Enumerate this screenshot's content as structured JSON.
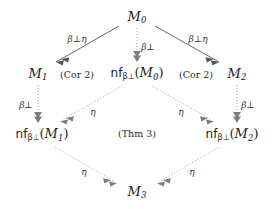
{
  "diagram": {
    "type": "commutative-diagram",
    "title": "",
    "nodes": [
      {
        "id": "M0",
        "label": "M",
        "sub": "0",
        "prefix": "",
        "x": 137,
        "y": 17
      },
      {
        "id": "M1",
        "label": "M",
        "sub": "1",
        "prefix": "",
        "x": 38,
        "y": 74
      },
      {
        "id": "nfM0",
        "label": "M",
        "sub": "0",
        "prefix": "nf",
        "opsub": "β⊥",
        "x": 137,
        "y": 74
      },
      {
        "id": "M2",
        "label": "M",
        "sub": "2",
        "prefix": "",
        "x": 237,
        "y": 74
      },
      {
        "id": "nfM1",
        "label": "M",
        "sub": "1",
        "prefix": "nf",
        "opsub": "β⊥",
        "x": 42,
        "y": 135
      },
      {
        "id": "nfM2",
        "label": "M",
        "sub": "2",
        "prefix": "nf",
        "opsub": "β⊥",
        "x": 232,
        "y": 135
      },
      {
        "id": "M3",
        "label": "M",
        "sub": "3",
        "prefix": "",
        "x": 137,
        "y": 192
      }
    ],
    "edges": [
      {
        "id": "e-M0-M1",
        "from": "M0",
        "to": "M1",
        "label": "β⊥η",
        "style": "solid",
        "head": "double",
        "label_x": 77,
        "label_y": 39
      },
      {
        "id": "e-M0-nfM0",
        "from": "M0",
        "to": "nfM0",
        "label": "β⊥",
        "style": "dotted",
        "head": "double",
        "label_x": 148,
        "label_y": 47
      },
      {
        "id": "e-M0-M2",
        "from": "M0",
        "to": "M2",
        "label": "β⊥η",
        "style": "solid",
        "head": "double",
        "label_x": 198,
        "label_y": 39
      },
      {
        "id": "e-M1-nfM1",
        "from": "M1",
        "to": "nfM1",
        "label": "β⊥",
        "style": "dotted",
        "head": "double",
        "label_x": 26,
        "label_y": 105
      },
      {
        "id": "e-M2-nfM2",
        "from": "M2",
        "to": "nfM2",
        "label": "β⊥",
        "style": "dotted",
        "head": "double",
        "label_x": 248,
        "label_y": 105
      },
      {
        "id": "e-nfM0-nfM1",
        "from": "nfM0",
        "to": "nfM1",
        "label": "η",
        "style": "dotted",
        "head": "double",
        "label_x": 93,
        "label_y": 112
      },
      {
        "id": "e-nfM0-nfM2",
        "from": "nfM0",
        "to": "nfM2",
        "label": "η",
        "style": "dotted",
        "head": "double",
        "label_x": 181,
        "label_y": 112
      },
      {
        "id": "e-nfM1-M3",
        "from": "nfM1",
        "to": "M3",
        "label": "η",
        "style": "dotted",
        "head": "double",
        "label_x": 84,
        "label_y": 172
      },
      {
        "id": "e-nfM2-M3",
        "from": "nfM2",
        "to": "M3",
        "label": "η",
        "style": "dotted",
        "head": "double",
        "label_x": 192,
        "label_y": 172
      }
    ],
    "region_labels": [
      {
        "id": "cor2-left",
        "text": "(Cor 2)",
        "x": 77,
        "y": 75
      },
      {
        "id": "cor2-right",
        "text": "(Cor 2)",
        "x": 196,
        "y": 75
      },
      {
        "id": "thm3",
        "text": "(Thm 3)",
        "x": 137,
        "y": 134
      }
    ],
    "colors": {
      "background": "#ffffff",
      "text": "#222222",
      "edge_solid": "#555555",
      "edge_dotted": "#9a9a9a"
    }
  }
}
